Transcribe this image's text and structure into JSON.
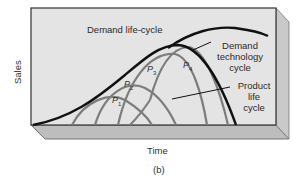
{
  "figure": {
    "panel_label": "(b)",
    "x_axis_label": "Time",
    "y_axis_label": "Sales",
    "curves": {
      "demand_life_cycle": "Demand life-cycle",
      "demand_technology_line1": "Demand",
      "demand_technology_line2": "technology",
      "demand_technology_line3": "cycle",
      "product_life_line1": "Product",
      "product_life_line2": "life",
      "product_life_line3": "cycle"
    },
    "products": [
      {
        "letter": "P",
        "sub": "1"
      },
      {
        "letter": "P",
        "sub": "2"
      },
      {
        "letter": "P",
        "sub": "3"
      },
      {
        "letter": "P",
        "sub": "4"
      }
    ],
    "colors": {
      "face": "#e4e4e4",
      "side": "#c9c9c9",
      "bottom": "#bdbdbd",
      "demand_curve": "#111111",
      "product_curve": "#7d7d7d"
    }
  }
}
